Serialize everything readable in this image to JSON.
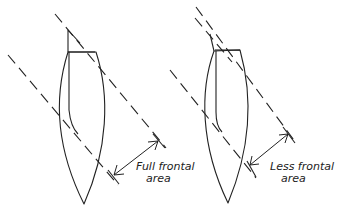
{
  "diagram": {
    "left_figure": {
      "label_line1": "Full frontal",
      "label_line2": "area"
    },
    "right_figure": {
      "label_line1": "Less frontal",
      "label_line2": "area"
    },
    "colors": {
      "stroke": "#222222",
      "background": "#ffffff"
    }
  }
}
